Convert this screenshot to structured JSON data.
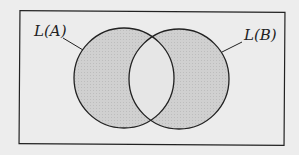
{
  "diagram": {
    "type": "venn",
    "universe_box": {
      "x": 19,
      "y": 11,
      "width": 265,
      "height": 133
    },
    "sets": [
      {
        "id": "A",
        "label": "L(A)",
        "cx": 124,
        "cy": 78,
        "r": 50
      },
      {
        "id": "B",
        "label": "L(B)",
        "cx": 179,
        "cy": 79,
        "r": 50
      }
    ],
    "shaded_region": "symmetric difference (A only and B only); intersection unshaded",
    "colors": {
      "background": "#ededed",
      "shade": "#d2d2d2",
      "intersection": "#e6e6e6",
      "stroke": "#222222"
    }
  },
  "labels": {
    "set_a": "L(A)",
    "set_b": "L(B)"
  }
}
